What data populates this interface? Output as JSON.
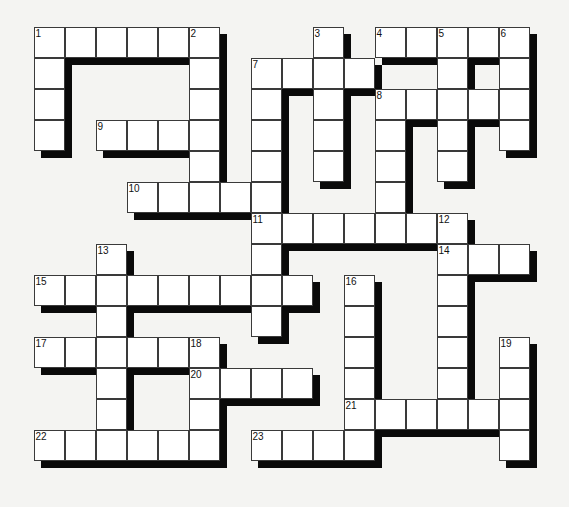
{
  "puzzle": {
    "type": "crossword",
    "rows": 14,
    "cols": 16,
    "cell_px": 31,
    "origin": {
      "x": 34,
      "y": 27
    },
    "colors": {
      "background": "#f4f4f2",
      "cell": "#ffffff",
      "shadow": "#0a0a0a",
      "border": "#3a3a3a"
    },
    "cells": [
      [
        0,
        0
      ],
      [
        0,
        1
      ],
      [
        0,
        2
      ],
      [
        0,
        3
      ],
      [
        0,
        4
      ],
      [
        0,
        5
      ],
      [
        0,
        9
      ],
      [
        0,
        11
      ],
      [
        0,
        12
      ],
      [
        0,
        13
      ],
      [
        0,
        14
      ],
      [
        0,
        15
      ],
      [
        1,
        0
      ],
      [
        1,
        5
      ],
      [
        1,
        7
      ],
      [
        1,
        8
      ],
      [
        1,
        9
      ],
      [
        1,
        10
      ],
      [
        1,
        13
      ],
      [
        1,
        15
      ],
      [
        2,
        0
      ],
      [
        2,
        5
      ],
      [
        2,
        7
      ],
      [
        2,
        9
      ],
      [
        2,
        11
      ],
      [
        2,
        12
      ],
      [
        2,
        13
      ],
      [
        2,
        14
      ],
      [
        2,
        15
      ],
      [
        3,
        0
      ],
      [
        3,
        2
      ],
      [
        3,
        3
      ],
      [
        3,
        4
      ],
      [
        3,
        5
      ],
      [
        3,
        7
      ],
      [
        3,
        9
      ],
      [
        3,
        11
      ],
      [
        3,
        13
      ],
      [
        3,
        15
      ],
      [
        4,
        5
      ],
      [
        4,
        7
      ],
      [
        4,
        9
      ],
      [
        4,
        11
      ],
      [
        4,
        13
      ],
      [
        5,
        3
      ],
      [
        5,
        4
      ],
      [
        5,
        5
      ],
      [
        5,
        6
      ],
      [
        5,
        7
      ],
      [
        5,
        11
      ],
      [
        6,
        7
      ],
      [
        6,
        8
      ],
      [
        6,
        9
      ],
      [
        6,
        10
      ],
      [
        6,
        11
      ],
      [
        6,
        12
      ],
      [
        6,
        13
      ],
      [
        7,
        2
      ],
      [
        7,
        7
      ],
      [
        7,
        13
      ],
      [
        7,
        14
      ],
      [
        7,
        15
      ],
      [
        8,
        0
      ],
      [
        8,
        1
      ],
      [
        8,
        2
      ],
      [
        8,
        3
      ],
      [
        8,
        4
      ],
      [
        8,
        5
      ],
      [
        8,
        6
      ],
      [
        8,
        7
      ],
      [
        8,
        8
      ],
      [
        8,
        10
      ],
      [
        8,
        13
      ],
      [
        9,
        2
      ],
      [
        9,
        7
      ],
      [
        9,
        10
      ],
      [
        9,
        13
      ],
      [
        10,
        0
      ],
      [
        10,
        1
      ],
      [
        10,
        2
      ],
      [
        10,
        3
      ],
      [
        10,
        4
      ],
      [
        10,
        5
      ],
      [
        10,
        10
      ],
      [
        10,
        13
      ],
      [
        10,
        15
      ],
      [
        11,
        2
      ],
      [
        11,
        5
      ],
      [
        11,
        6
      ],
      [
        11,
        7
      ],
      [
        11,
        8
      ],
      [
        11,
        10
      ],
      [
        11,
        13
      ],
      [
        11,
        15
      ],
      [
        12,
        2
      ],
      [
        12,
        5
      ],
      [
        12,
        10
      ],
      [
        12,
        11
      ],
      [
        12,
        12
      ],
      [
        12,
        13
      ],
      [
        12,
        14
      ],
      [
        12,
        15
      ],
      [
        13,
        0
      ],
      [
        13,
        1
      ],
      [
        13,
        2
      ],
      [
        13,
        3
      ],
      [
        13,
        4
      ],
      [
        13,
        5
      ],
      [
        13,
        7
      ],
      [
        13,
        8
      ],
      [
        13,
        9
      ],
      [
        13,
        10
      ],
      [
        13,
        15
      ]
    ],
    "numbers": [
      {
        "n": "1",
        "r": 0,
        "c": 0
      },
      {
        "n": "2",
        "r": 0,
        "c": 5
      },
      {
        "n": "3",
        "r": 0,
        "c": 9
      },
      {
        "n": "4",
        "r": 0,
        "c": 11
      },
      {
        "n": "5",
        "r": 0,
        "c": 13
      },
      {
        "n": "6",
        "r": 0,
        "c": 15
      },
      {
        "n": "7",
        "r": 1,
        "c": 7
      },
      {
        "n": "8",
        "r": 2,
        "c": 11
      },
      {
        "n": "9",
        "r": 3,
        "c": 2
      },
      {
        "n": "10",
        "r": 5,
        "c": 3
      },
      {
        "n": "11",
        "r": 6,
        "c": 7
      },
      {
        "n": "12",
        "r": 6,
        "c": 13
      },
      {
        "n": "13",
        "r": 7,
        "c": 2
      },
      {
        "n": "14",
        "r": 7,
        "c": 13
      },
      {
        "n": "15",
        "r": 8,
        "c": 0
      },
      {
        "n": "16",
        "r": 8,
        "c": 10
      },
      {
        "n": "17",
        "r": 10,
        "c": 0
      },
      {
        "n": "18",
        "r": 10,
        "c": 5
      },
      {
        "n": "19",
        "r": 10,
        "c": 15
      },
      {
        "n": "20",
        "r": 11,
        "c": 5
      },
      {
        "n": "21",
        "r": 12,
        "c": 10
      },
      {
        "n": "22",
        "r": 13,
        "c": 0
      },
      {
        "n": "23",
        "r": 13,
        "c": 7
      }
    ]
  }
}
